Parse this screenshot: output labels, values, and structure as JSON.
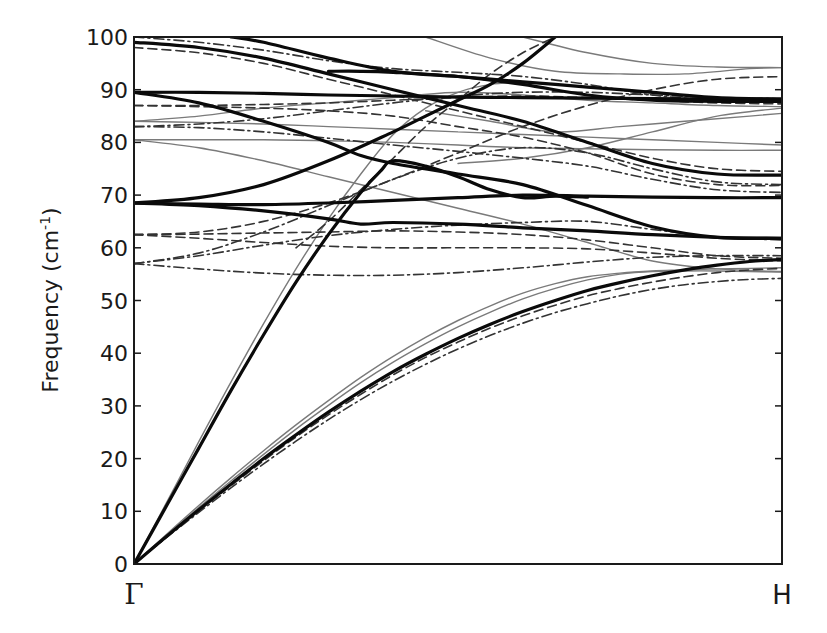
{
  "chart_data": {
    "type": "line",
    "title": "",
    "xlabel": "",
    "ylabel": "Frequency (cm-1)",
    "ylabel_parts": {
      "base": "Frequency (cm",
      "sup": "-1",
      "tail": ")"
    },
    "x_ticks": [
      "Γ",
      "H"
    ],
    "y_ticks": [
      0,
      10,
      20,
      30,
      40,
      50,
      60,
      70,
      80,
      90,
      100
    ],
    "xlim": [
      0,
      1
    ],
    "ylim": [
      0,
      100
    ],
    "grid": false,
    "legend": null,
    "styles": {
      "thick": {
        "color": "#0a0a0a",
        "width": 3.2,
        "dash": ""
      },
      "thin": {
        "color": "#7a7a7a",
        "width": 1.4,
        "dash": ""
      },
      "dashed": {
        "color": "#333333",
        "width": 1.6,
        "dash": "9,5"
      },
      "dashdot": {
        "color": "#333333",
        "width": 1.6,
        "dash": "10,4,2,4"
      }
    },
    "series": [
      {
        "name": "acoustic-LA-thick",
        "style": "thick",
        "x": [
          0,
          0.05,
          0.1,
          0.15,
          0.2,
          0.25,
          0.3,
          0.35,
          0.4,
          0.45,
          0.5,
          0.55,
          0.6,
          0.65,
          0.7,
          0.75,
          0.8,
          0.85,
          0.9,
          0.95,
          1
        ],
        "y": [
          0,
          5.2,
          10.3,
          15.2,
          20,
          24.5,
          28.8,
          32.8,
          36.5,
          39.8,
          42.8,
          45.5,
          47.9,
          50,
          51.9,
          53.4,
          54.7,
          55.8,
          56.7,
          57.4,
          57.8
        ]
      },
      {
        "name": "acoustic-TA-thin",
        "style": "thin",
        "x": [
          0,
          0.05,
          0.1,
          0.15,
          0.2,
          0.25,
          0.3,
          0.35,
          0.4,
          0.45,
          0.5,
          0.55,
          0.6,
          0.65,
          0.7,
          0.75,
          0.8,
          0.85,
          0.9,
          0.95,
          1
        ],
        "y": [
          0,
          5.6,
          11.1,
          16.4,
          21.5,
          26.4,
          31,
          35.4,
          39.4,
          43,
          46.2,
          49,
          51.4,
          53.2,
          54.5,
          55.2,
          55.6,
          55.8,
          56,
          56.1,
          56.2
        ]
      },
      {
        "name": "acoustic-TA2-thin",
        "style": "thin",
        "x": [
          0,
          0.05,
          0.1,
          0.15,
          0.2,
          0.25,
          0.3,
          0.35,
          0.4,
          0.45,
          0.5,
          0.55,
          0.6,
          0.65,
          0.7,
          0.75,
          0.8,
          0.85,
          0.9,
          0.95,
          1
        ],
        "y": [
          0,
          5.4,
          10.7,
          15.8,
          20.8,
          25.6,
          30.1,
          34.4,
          38.3,
          41.8,
          45,
          47.8,
          50.3,
          52.3,
          53.9,
          55,
          55.5,
          55.6,
          55.6,
          55.5,
          55.4
        ]
      },
      {
        "name": "acoustic-dashed",
        "style": "dashed",
        "x": [
          0,
          0.05,
          0.1,
          0.15,
          0.2,
          0.25,
          0.3,
          0.35,
          0.4,
          0.45,
          0.5,
          0.55,
          0.6,
          0.65,
          0.7,
          0.75,
          0.8,
          0.85,
          0.9,
          0.95,
          1
        ],
        "y": [
          0,
          5.1,
          10.1,
          14.9,
          19.6,
          24.1,
          28.3,
          32.2,
          35.9,
          39.2,
          42.1,
          44.8,
          47.1,
          49.1,
          50.9,
          52.3,
          53.5,
          54.5,
          55.3,
          55.8,
          56.1
        ]
      },
      {
        "name": "acoustic-dashdot",
        "style": "dashdot",
        "x": [
          0,
          0.05,
          0.1,
          0.15,
          0.2,
          0.25,
          0.3,
          0.35,
          0.4,
          0.45,
          0.5,
          0.55,
          0.6,
          0.65,
          0.7,
          0.75,
          0.8,
          0.85,
          0.9,
          0.95,
          1
        ],
        "y": [
          0,
          5,
          9.8,
          14.5,
          19,
          23.3,
          27.4,
          31.2,
          34.7,
          37.9,
          40.8,
          43.4,
          45.7,
          47.7,
          49.4,
          50.9,
          52.1,
          53,
          53.6,
          54,
          54.2
        ]
      },
      {
        "name": "steep-acoustic-thick",
        "style": "thick",
        "x": [
          0,
          0.05,
          0.1,
          0.15,
          0.2,
          0.25,
          0.3,
          0.35,
          0.38,
          0.4,
          0.45,
          0.5,
          0.55,
          0.6,
          0.65,
          0.7
        ],
        "y": [
          0,
          11,
          22,
          33,
          43.5,
          53.5,
          62.5,
          70.5,
          74.5,
          76.5,
          75.5,
          73.5,
          71,
          69.5,
          69.8,
          69.6
        ]
      },
      {
        "name": "steep-acoustic-thin",
        "style": "thin",
        "x": [
          0,
          0.05,
          0.1,
          0.15,
          0.2,
          0.25,
          0.3,
          0.35,
          0.4,
          0.45,
          0.5,
          0.55,
          0.6
        ],
        "y": [
          0,
          11.6,
          23.2,
          34.6,
          45.6,
          56,
          65.5,
          74,
          81.5,
          86.5,
          89.5,
          91,
          91.5
        ]
      },
      {
        "name": "optic-68-thick-flat",
        "style": "thick",
        "x": [
          0,
          0.1,
          0.2,
          0.3,
          0.4,
          0.5,
          0.6,
          0.7,
          0.8,
          0.9,
          1
        ],
        "y": [
          68.5,
          68.3,
          68.2,
          68.5,
          69,
          69.5,
          70,
          69.8,
          69.6,
          69.5,
          69.5
        ]
      },
      {
        "name": "optic-68-thick-down",
        "style": "thick",
        "x": [
          0,
          0.1,
          0.2,
          0.3,
          0.35,
          0.4,
          0.5,
          0.6,
          0.7,
          0.8,
          0.9,
          1
        ],
        "y": [
          68.5,
          68,
          67,
          65.5,
          64.5,
          64.8,
          64.5,
          63.8,
          63.2,
          62.5,
          62,
          61.8
        ]
      },
      {
        "name": "optic-68-thick-up",
        "style": "thick",
        "x": [
          0,
          0.1,
          0.2,
          0.3,
          0.4,
          0.45,
          0.5,
          0.55,
          0.6,
          0.65
        ],
        "y": [
          68.5,
          69.5,
          72,
          76.5,
          82,
          85,
          88,
          91,
          95,
          100
        ]
      },
      {
        "name": "optic-89-thick",
        "style": "thick",
        "x": [
          0,
          0.1,
          0.2,
          0.3,
          0.4,
          0.5,
          0.6,
          0.7,
          0.8,
          0.9,
          1
        ],
        "y": [
          89.5,
          89.5,
          89.3,
          89,
          88.8,
          88.6,
          88.5,
          88.4,
          88.3,
          88.2,
          88.2
        ]
      },
      {
        "name": "optic-89-thick-down",
        "style": "thick",
        "x": [
          0,
          0.1,
          0.2,
          0.3,
          0.35,
          0.4,
          0.5,
          0.6,
          0.7,
          0.8,
          0.9,
          1
        ],
        "y": [
          89.5,
          87.5,
          84,
          80,
          77.5,
          76,
          74,
          72,
          68,
          64,
          62,
          61.8
        ]
      },
      {
        "name": "optic-99-thick",
        "style": "thick",
        "x": [
          0,
          0.1,
          0.2,
          0.3,
          0.4,
          0.5,
          0.6,
          0.7,
          0.8,
          0.9,
          1
        ],
        "y": [
          99,
          98,
          96,
          93,
          90,
          87,
          84,
          80,
          76,
          74,
          73.8
        ]
      },
      {
        "name": "optic-100-thick",
        "style": "thick",
        "x": [
          0.15,
          0.2,
          0.3,
          0.4,
          0.5,
          0.6,
          0.7,
          0.8,
          0.9,
          1
        ],
        "y": [
          100,
          99,
          96,
          93.5,
          92.5,
          91.5,
          90.5,
          89.5,
          88.5,
          88.2
        ]
      },
      {
        "name": "optic-93-thick",
        "style": "thick",
        "x": [
          0.3,
          0.35,
          0.4,
          0.5,
          0.6,
          0.7,
          0.8,
          0.9,
          1
        ],
        "y": [
          93.5,
          93.5,
          93.3,
          92.5,
          91,
          89,
          88,
          87.8,
          87.8
        ]
      },
      {
        "name": "optic-thin-84a",
        "style": "thin",
        "x": [
          0,
          0.1,
          0.2,
          0.3,
          0.4,
          0.5,
          0.6,
          0.7,
          0.8,
          0.9,
          1
        ],
        "y": [
          84,
          83.8,
          83.5,
          83,
          82.5,
          82,
          81.5,
          81,
          80.5,
          80,
          79.5
        ]
      },
      {
        "name": "optic-thin-84b",
        "style": "thin",
        "x": [
          0,
          0.1,
          0.2,
          0.3,
          0.4,
          0.5,
          0.6,
          0.7,
          0.8,
          0.9,
          1
        ],
        "y": [
          84,
          85,
          86.5,
          87.5,
          88.5,
          89.5,
          89,
          88,
          87.5,
          87,
          86.8
        ]
      },
      {
        "name": "optic-thin-80",
        "style": "thin",
        "x": [
          0,
          0.1,
          0.2,
          0.3,
          0.4,
          0.5,
          0.6,
          0.7,
          0.8,
          0.9,
          1
        ],
        "y": [
          80.5,
          80.5,
          80.5,
          80.3,
          80,
          79.5,
          79,
          78.8,
          78.6,
          78.5,
          78.5
        ]
      },
      {
        "name": "optic-thin-80-down",
        "style": "thin",
        "x": [
          0,
          0.1,
          0.2,
          0.3,
          0.4,
          0.5,
          0.6,
          0.7,
          0.8,
          0.9,
          1
        ],
        "y": [
          80.5,
          79,
          76.5,
          73.5,
          70.5,
          67.5,
          64.5,
          61,
          57.5,
          56,
          55.5
        ]
      },
      {
        "name": "optic-thin-top-a",
        "style": "thin",
        "x": [
          0.45,
          0.55,
          0.65,
          0.75,
          0.85,
          0.95,
          1
        ],
        "y": [
          100,
          96,
          93.5,
          93,
          93,
          94,
          94.2
        ]
      },
      {
        "name": "optic-thin-top-b",
        "style": "thin",
        "x": [
          0.6,
          0.7,
          0.8,
          0.9,
          1
        ],
        "y": [
          100,
          97,
          95,
          94.3,
          94.2
        ]
      },
      {
        "name": "optic-thin-mid",
        "style": "thin",
        "x": [
          0.45,
          0.55,
          0.65,
          0.75,
          0.85,
          0.95,
          1
        ],
        "y": [
          86,
          84,
          82,
          83,
          84,
          85,
          85.5
        ]
      },
      {
        "name": "optic-thin-mid2",
        "style": "thin",
        "x": [
          0.5,
          0.6,
          0.7,
          0.8,
          0.9,
          1
        ],
        "y": [
          76,
          77,
          79,
          82,
          85,
          86.5
        ]
      },
      {
        "name": "dashed-98",
        "style": "dashed",
        "x": [
          0,
          0.1,
          0.2,
          0.3,
          0.4,
          0.5,
          0.6,
          0.7,
          0.8,
          0.9,
          1
        ],
        "y": [
          98,
          97,
          95,
          92,
          89,
          86,
          83,
          80,
          77,
          75,
          74.5
        ]
      },
      {
        "name": "dashed-87",
        "style": "dashed",
        "x": [
          0,
          0.1,
          0.2,
          0.3,
          0.4,
          0.5,
          0.6,
          0.7,
          0.8,
          0.9,
          1
        ],
        "y": [
          87,
          86.8,
          86.5,
          86,
          85,
          83,
          81,
          78,
          74,
          72,
          71.8
        ]
      },
      {
        "name": "dashed-87b",
        "style": "dashed",
        "x": [
          0,
          0.1,
          0.2,
          0.3,
          0.4,
          0.5,
          0.6,
          0.7,
          0.8,
          0.9,
          1
        ],
        "y": [
          87,
          87,
          87.2,
          87.5,
          88,
          88.5,
          88.8,
          88.5,
          88,
          87.5,
          87.3
        ]
      },
      {
        "name": "dashed-62a",
        "style": "dashed",
        "x": [
          0,
          0.1,
          0.2,
          0.3,
          0.4,
          0.5,
          0.6,
          0.7,
          0.8,
          0.9,
          1
        ],
        "y": [
          62.5,
          62.6,
          62.8,
          63,
          63.2,
          63,
          62.5,
          61.5,
          60,
          58.5,
          58
        ]
      },
      {
        "name": "dashed-62b",
        "style": "dashed",
        "x": [
          0,
          0.1,
          0.2,
          0.3,
          0.4,
          0.5,
          0.6,
          0.7,
          0.8,
          0.9,
          1
        ],
        "y": [
          62.5,
          63,
          65,
          68.5,
          73,
          78,
          83,
          87,
          90,
          92,
          92.5
        ]
      },
      {
        "name": "dashed-62c",
        "style": "dashed",
        "x": [
          0,
          0.1,
          0.2,
          0.3,
          0.4,
          0.5,
          0.6,
          0.7,
          0.8,
          0.9,
          1
        ],
        "y": [
          62.5,
          61.8,
          61,
          60.3,
          60,
          60,
          60,
          59.8,
          59,
          58,
          57.5
        ]
      },
      {
        "name": "dashed-upper-cross",
        "style": "dashed",
        "x": [
          0.25,
          0.3,
          0.35,
          0.4,
          0.45,
          0.5,
          0.55,
          0.6,
          0.65
        ],
        "y": [
          60,
          65,
          71,
          77,
          83,
          88,
          93,
          97,
          100
        ]
      },
      {
        "name": "dashdot-83",
        "style": "dashdot",
        "x": [
          0,
          0.1,
          0.2,
          0.3,
          0.4,
          0.5,
          0.6,
          0.7,
          0.8,
          0.9,
          1
        ],
        "y": [
          83,
          82.8,
          82,
          80.8,
          79.5,
          78.3,
          77,
          75.5,
          73,
          71,
          70.5
        ]
      },
      {
        "name": "dashdot-83b",
        "style": "dashdot",
        "x": [
          0,
          0.1,
          0.2,
          0.3,
          0.4,
          0.5,
          0.6,
          0.7,
          0.8,
          0.9,
          1
        ],
        "y": [
          83,
          83.5,
          84.5,
          86,
          87.5,
          88.8,
          89.5,
          89.5,
          89,
          88.5,
          88.3
        ]
      },
      {
        "name": "dashdot-57a",
        "style": "dashdot",
        "x": [
          0,
          0.1,
          0.2,
          0.3,
          0.4,
          0.5,
          0.6,
          0.7,
          0.8,
          0.9,
          1
        ],
        "y": [
          57,
          56,
          55.2,
          54.8,
          54.8,
          55.3,
          56.2,
          57.3,
          58.2,
          58.5,
          58.5
        ]
      },
      {
        "name": "dashdot-57b",
        "style": "dashdot",
        "x": [
          0,
          0.1,
          0.2,
          0.3,
          0.4,
          0.5,
          0.6,
          0.7,
          0.8,
          0.9,
          1
        ],
        "y": [
          57,
          58.5,
          60.5,
          62.3,
          63.5,
          64.3,
          64.8,
          65,
          63.5,
          62,
          61.5
        ]
      },
      {
        "name": "dashdot-57c",
        "style": "dashdot",
        "x": [
          0,
          0.1,
          0.2,
          0.3,
          0.4,
          0.5,
          0.6,
          0.7,
          0.8,
          0.9,
          1
        ],
        "y": [
          57,
          59,
          63,
          68,
          73,
          77,
          79,
          78,
          75,
          72.5,
          72
        ]
      },
      {
        "name": "dashdot-top",
        "style": "dashdot",
        "x": [
          0,
          0.1,
          0.2,
          0.3,
          0.4,
          0.5,
          0.6,
          0.7,
          0.8,
          0.9,
          1
        ],
        "y": [
          100,
          99,
          97.5,
          95.5,
          94,
          93.3,
          92.5,
          91,
          89,
          88,
          87.8
        ]
      }
    ]
  },
  "plot": {
    "x_labels": {
      "gamma": "Γ",
      "h": "H"
    },
    "y_tick_labels": [
      "0",
      "10",
      "20",
      "30",
      "40",
      "50",
      "60",
      "70",
      "80",
      "90",
      "100"
    ],
    "axis_color": "#1a1a1a"
  }
}
